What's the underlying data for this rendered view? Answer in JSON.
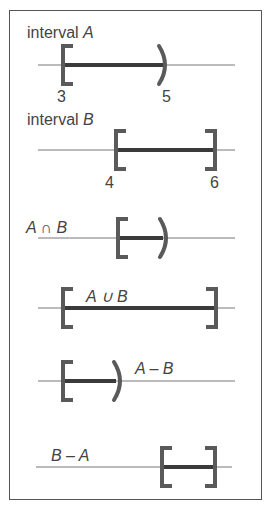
{
  "diagram": {
    "panels": [
      {
        "id": "A",
        "label_prefix": "interval ",
        "label_var": "A",
        "left": 3,
        "right": 5,
        "left_type": "closed",
        "right_type": "open",
        "tick_left": "3",
        "tick_right": "5"
      },
      {
        "id": "B",
        "label_prefix": "interval ",
        "label_var": "B",
        "left": 4,
        "right": 6,
        "left_type": "closed",
        "right_type": "closed",
        "tick_left": "4",
        "tick_right": "6"
      },
      {
        "id": "intersection",
        "label": "A ∩ B",
        "left": 4,
        "right": 5,
        "left_type": "closed",
        "right_type": "open"
      },
      {
        "id": "union",
        "label": "A ∪ B",
        "left": 3,
        "right": 6,
        "left_type": "closed",
        "right_type": "closed"
      },
      {
        "id": "a_minus_b",
        "label": "A – B",
        "left": 3,
        "right": 4,
        "left_type": "closed",
        "right_type": "open"
      },
      {
        "id": "b_minus_a",
        "label": "B – A",
        "left": 5,
        "right": 6,
        "left_type": "closed",
        "right_type": "closed"
      }
    ],
    "colors": {
      "line": "#777777",
      "segment": "#3a3a3a",
      "bracket": "#5a5a5a",
      "text": "#444444",
      "border": "#555555"
    }
  }
}
